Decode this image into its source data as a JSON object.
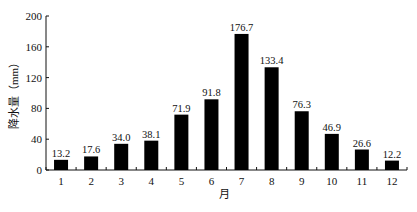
{
  "chart_data": {
    "type": "bar",
    "title": "",
    "xlabel": "月",
    "ylabel": "降水量（mm）",
    "categories": [
      "1",
      "2",
      "3",
      "4",
      "5",
      "6",
      "7",
      "8",
      "9",
      "10",
      "11",
      "12"
    ],
    "values": [
      13.2,
      17.6,
      34.0,
      38.1,
      71.9,
      91.8,
      176.7,
      133.4,
      76.3,
      46.9,
      26.6,
      12.2
    ],
    "value_labels": [
      "13.2",
      "17.6",
      "34.0",
      "38.1",
      "71.9",
      "91.8",
      "176.7",
      "133.4",
      "76.3",
      "46.9",
      "26.6",
      "12.2"
    ],
    "ylim": [
      0,
      200
    ],
    "yticks": [
      0,
      40,
      80,
      120,
      160,
      200
    ],
    "grid": false,
    "legend": null,
    "bar_color": "#000000"
  }
}
